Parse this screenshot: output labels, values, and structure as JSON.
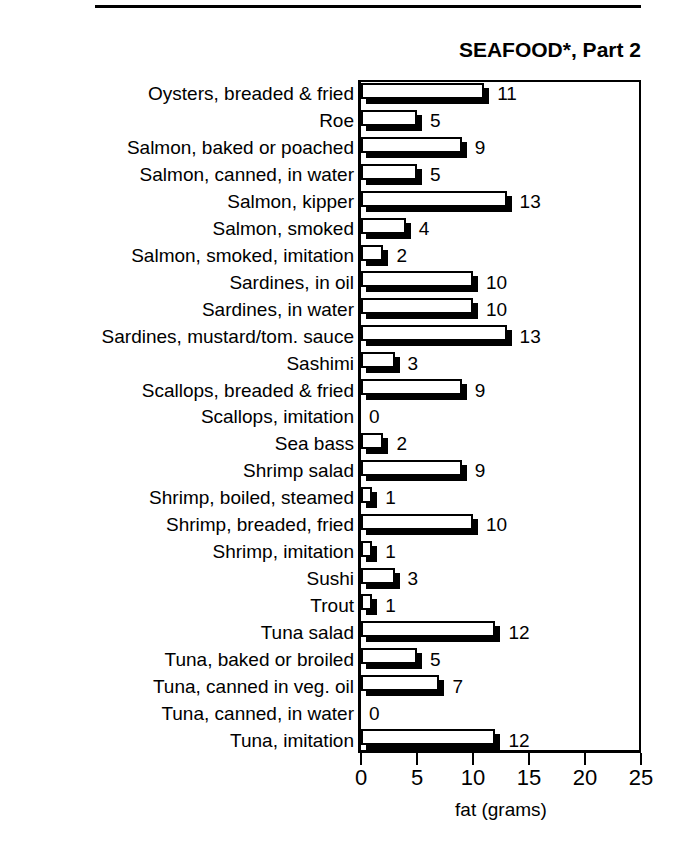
{
  "chart_data": {
    "type": "bar",
    "title": "SEAFOOD*, Part 2",
    "xlabel": "fat (grams)",
    "ylabel": "",
    "orientation": "horizontal",
    "xlim": [
      0,
      25
    ],
    "xticks": [
      0,
      5,
      10,
      15,
      20,
      25
    ],
    "xtick_labels": [
      "0",
      "5",
      "10",
      "15",
      "20",
      "25"
    ],
    "grid": false,
    "legend": "none",
    "bar_style": "3d-drop-shadow-white-face",
    "categories": [
      "Oysters, breaded & fried",
      "Roe",
      "Salmon, baked or poached",
      "Salmon, canned, in water",
      "Salmon, kipper",
      "Salmon, smoked",
      "Salmon, smoked,  imitation",
      "Sardines, in oil",
      "Sardines, in water",
      "Sardines, mustard/tom. sauce",
      "Sashimi",
      "Scallops, breaded & fried",
      "Scallops, imitation",
      "Sea bass",
      "Shrimp salad",
      "Shrimp, boiled, steamed",
      "Shrimp, breaded, fried",
      "Shrimp, imitation",
      "Sushi",
      "Trout",
      "Tuna salad",
      "Tuna, baked or broiled",
      "Tuna, canned in veg. oil",
      "Tuna, canned, in water",
      "Tuna, imitation"
    ],
    "values": [
      11,
      5,
      9,
      5,
      13,
      4,
      2,
      10,
      10,
      13,
      3,
      9,
      0,
      2,
      9,
      1,
      10,
      1,
      3,
      1,
      12,
      5,
      7,
      0,
      12
    ],
    "value_labels": [
      "11",
      "5",
      "9",
      "5",
      "13",
      "4",
      "2",
      "10",
      "10",
      "13",
      "3",
      "9",
      "0",
      "2",
      "9",
      "1",
      "10",
      "1",
      "3",
      "1",
      "12",
      "5",
      "7",
      "0",
      "12"
    ]
  },
  "colors": {
    "bar_face": "#ffffff",
    "bar_shadow": "#000000",
    "outline": "#000000",
    "background": "#ffffff",
    "text": "#000000"
  }
}
